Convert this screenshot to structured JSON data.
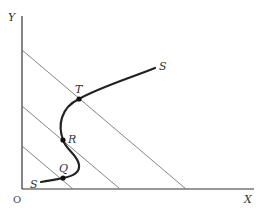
{
  "diagram": {
    "axes": {
      "y_label": "Y",
      "x_label": "X",
      "origin_label": "O"
    },
    "curve": {
      "name": "S",
      "start_label": "S",
      "end_label": "S"
    },
    "points": [
      {
        "label": "T"
      },
      {
        "label": "R"
      },
      {
        "label": "Q"
      }
    ],
    "colors": {
      "axis": "#333333",
      "lines": "#777777",
      "curve": "#222222"
    }
  }
}
